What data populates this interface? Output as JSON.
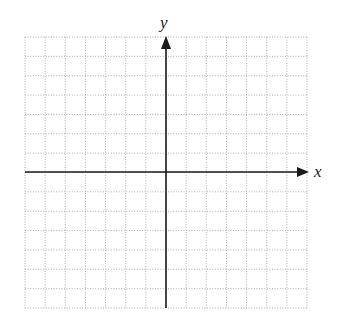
{
  "diagram": {
    "type": "coordinate-plane",
    "labels": {
      "x_axis": "x",
      "y_axis": "y"
    },
    "grid": {
      "left": 25,
      "top": 37,
      "right": 307,
      "bottom": 308,
      "columns": 14,
      "rows": 14,
      "line_color": "#9a9a9a",
      "line_style": "dotted"
    },
    "axes": {
      "origin_x": 166,
      "origin_y": 172,
      "color": "#1a1a1a",
      "x_arrow_tip": 309,
      "y_arrow_tip": 36
    }
  }
}
